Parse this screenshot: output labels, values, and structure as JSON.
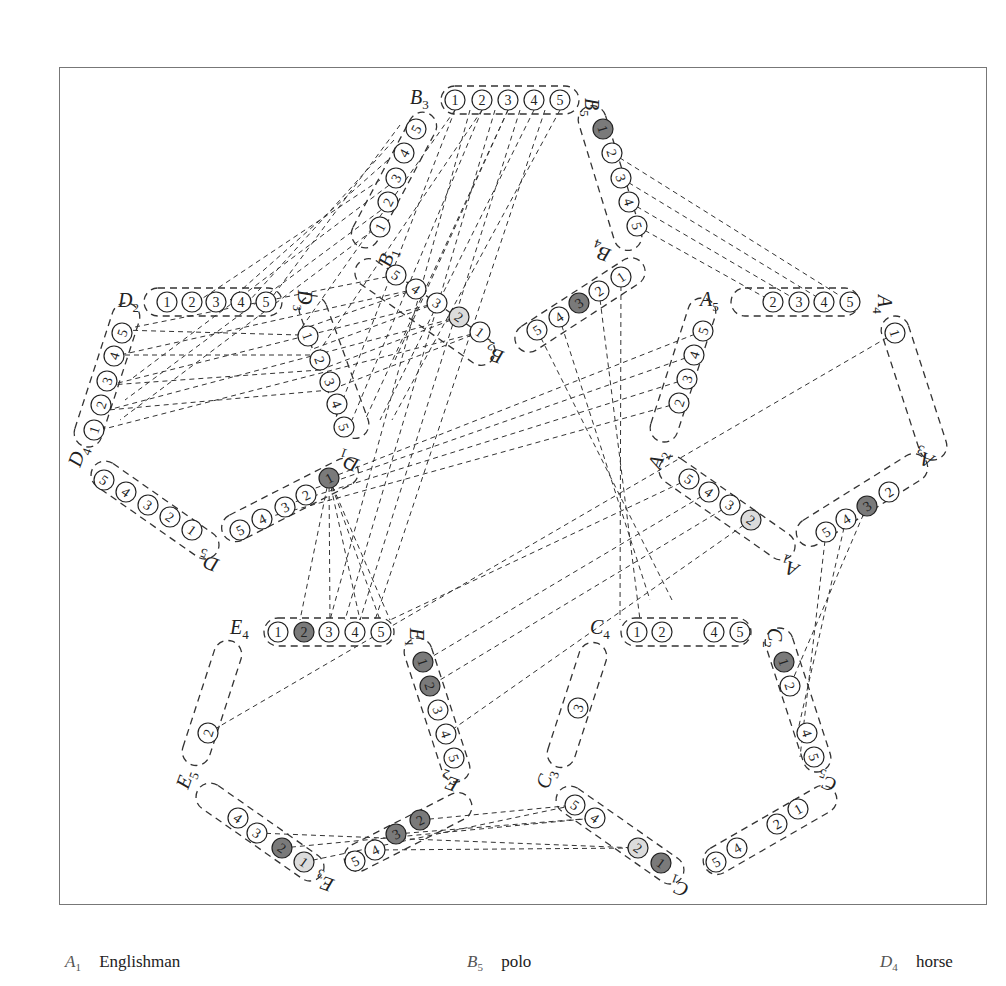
{
  "colors": {
    "line": "#333333",
    "frame": "#777777",
    "filled_dark": "#7a7a7a",
    "filled_light": "#dcdcdc",
    "background": "#ffffff"
  },
  "legend": [
    {
      "var": "A",
      "sub": "1",
      "meaning": "Englishman",
      "x": 65
    },
    {
      "var": "B",
      "sub": "5",
      "meaning": "polo",
      "x": 467
    },
    {
      "var": "D",
      "sub": "4",
      "meaning": "horse",
      "x": 880
    }
  ],
  "groups": [
    {
      "id": "B3",
      "label": "B",
      "sub": "3",
      "lx": 410,
      "ly": 104,
      "lrot": 0,
      "cx": 510,
      "cy": 100,
      "angle": 0,
      "len": 138,
      "wid": 28,
      "values": [
        {
          "n": "1",
          "x": 455,
          "y": 100
        },
        {
          "n": "2",
          "x": 482,
          "y": 100
        },
        {
          "n": "3",
          "x": 508,
          "y": 100
        },
        {
          "n": "4",
          "x": 534,
          "y": 100
        },
        {
          "n": "5",
          "x": 560,
          "y": 100
        }
      ]
    },
    {
      "id": "B5",
      "label": "B",
      "sub": "5",
      "lx": 585,
      "ly": 98,
      "lrot": 90,
      "cx": 610,
      "cy": 178,
      "angle": 73,
      "len": 150,
      "wid": 28,
      "values": [
        {
          "n": "1",
          "x": 603,
          "y": 129,
          "fill": "dark"
        },
        {
          "n": "2",
          "x": 612,
          "y": 153
        },
        {
          "n": "3",
          "x": 621,
          "y": 178
        },
        {
          "n": "4",
          "x": 629,
          "y": 202
        },
        {
          "n": "5",
          "x": 637,
          "y": 226
        }
      ]
    },
    {
      "id": "B1",
      "label": "B",
      "sub": "1",
      "lx": 390,
      "ly": 268,
      "lrot": -70,
      "cx": 394,
      "cy": 180,
      "angle": -62,
      "len": 150,
      "wid": 28,
      "values": [
        {
          "n": "1",
          "x": 380,
          "y": 227
        },
        {
          "n": "2",
          "x": 388,
          "y": 202
        },
        {
          "n": "3",
          "x": 396,
          "y": 178
        },
        {
          "n": "4",
          "x": 404,
          "y": 153
        },
        {
          "n": "5",
          "x": 416,
          "y": 129
        }
      ]
    },
    {
      "id": "D2",
      "label": "D",
      "sub": "2",
      "lx": 118,
      "ly": 307,
      "lrot": 0,
      "cx": 213,
      "cy": 302,
      "angle": 0,
      "len": 138,
      "wid": 28,
      "values": [
        {
          "n": "1",
          "x": 167,
          "y": 302
        },
        {
          "n": "2",
          "x": 192,
          "y": 302
        },
        {
          "n": "3",
          "x": 216,
          "y": 302
        },
        {
          "n": "4",
          "x": 241,
          "y": 302
        },
        {
          "n": "5",
          "x": 266,
          "y": 302
        }
      ]
    },
    {
      "id": "D3",
      "label": "D",
      "sub": "3",
      "lx": 298,
      "ly": 290,
      "lrot": 90,
      "cx": 334,
      "cy": 367,
      "angle": 70,
      "len": 150,
      "wid": 28,
      "values": [
        {
          "n": "1",
          "x": 308,
          "y": 336
        },
        {
          "n": "2",
          "x": 320,
          "y": 360
        },
        {
          "n": "3",
          "x": 330,
          "y": 382
        },
        {
          "n": "4",
          "x": 337,
          "y": 404
        },
        {
          "n": "5",
          "x": 344,
          "y": 427
        }
      ]
    },
    {
      "id": "D4",
      "label": "D",
      "sub": "4",
      "lx": 80,
      "ly": 468,
      "lrot": -70,
      "cx": 107,
      "cy": 375,
      "angle": -72,
      "len": 150,
      "wid": 28,
      "values": [
        {
          "n": "1",
          "x": 94,
          "y": 430
        },
        {
          "n": "2",
          "x": 101,
          "y": 405
        },
        {
          "n": "3",
          "x": 107,
          "y": 381
        },
        {
          "n": "4",
          "x": 114,
          "y": 356
        },
        {
          "n": "5",
          "x": 122,
          "y": 333
        }
      ]
    },
    {
      "id": "D5",
      "label": "D",
      "sub": "5",
      "lx": 220,
      "ly": 560,
      "lrot": 200,
      "cx": 155,
      "cy": 510,
      "angle": 35,
      "len": 150,
      "wid": 28,
      "values": [
        {
          "n": "5",
          "x": 104,
          "y": 480
        },
        {
          "n": "4",
          "x": 126,
          "y": 492
        },
        {
          "n": "3",
          "x": 148,
          "y": 505
        },
        {
          "n": "2",
          "x": 170,
          "y": 517
        },
        {
          "n": "1",
          "x": 192,
          "y": 530
        }
      ]
    },
    {
      "id": "D1",
      "label": "D",
      "sub": "1",
      "lx": 360,
      "ly": 460,
      "lrot": 200,
      "cx": 290,
      "cy": 500,
      "angle": -27,
      "len": 150,
      "wid": 28,
      "values": [
        {
          "n": "5",
          "x": 240,
          "y": 530
        },
        {
          "n": "4",
          "x": 262,
          "y": 519
        },
        {
          "n": "3",
          "x": 285,
          "y": 507
        },
        {
          "n": "2",
          "x": 306,
          "y": 495
        },
        {
          "n": "1",
          "x": 329,
          "y": 478,
          "fill": "dark"
        }
      ]
    },
    {
      "id": "B2",
      "label": "B",
      "sub": "2",
      "lx": 505,
      "ly": 352,
      "lrot": 200,
      "cx": 425,
      "cy": 312,
      "angle": 35,
      "len": 165,
      "wid": 28,
      "values": [
        {
          "n": "5",
          "x": 396,
          "y": 275
        },
        {
          "n": "4",
          "x": 416,
          "y": 289
        },
        {
          "n": "3",
          "x": 437,
          "y": 303
        },
        {
          "n": "2",
          "x": 459,
          "y": 317,
          "fill": "light"
        },
        {
          "n": "1",
          "x": 480,
          "y": 332
        }
      ]
    },
    {
      "id": "B4",
      "label": "B",
      "sub": "4",
      "lx": 612,
      "ly": 250,
      "lrot": 200,
      "cx": 580,
      "cy": 305,
      "angle": -33,
      "len": 150,
      "wid": 28,
      "values": [
        {
          "n": "5",
          "x": 537,
          "y": 330
        },
        {
          "n": "4",
          "x": 559,
          "y": 317
        },
        {
          "n": "3",
          "x": 579,
          "y": 303,
          "fill": "dark"
        },
        {
          "n": "2",
          "x": 599,
          "y": 291
        },
        {
          "n": "1",
          "x": 621,
          "y": 277
        }
      ]
    },
    {
      "id": "A5",
      "label": "A",
      "sub": "5",
      "lx": 700,
      "ly": 306,
      "lrot": 0,
      "cx": 795,
      "cy": 302,
      "angle": 0,
      "len": 128,
      "wid": 28,
      "values": [
        {
          "n": "2",
          "x": 773,
          "y": 302
        },
        {
          "n": "3",
          "x": 799,
          "y": 302
        },
        {
          "n": "4",
          "x": 824,
          "y": 302
        },
        {
          "n": "5",
          "x": 850,
          "y": 302
        }
      ]
    },
    {
      "id": "A4",
      "label": "A",
      "sub": "4",
      "lx": 878,
      "ly": 295,
      "lrot": 90,
      "cx": 914,
      "cy": 388,
      "angle": 72,
      "len": 150,
      "wid": 28,
      "values": [
        {
          "n": "1",
          "x": 895,
          "y": 333
        }
      ]
    },
    {
      "id": "A2",
      "label": "A",
      "sub": "2",
      "lx": 660,
      "ly": 470,
      "lrot": -70,
      "cx": 683,
      "cy": 370,
      "angle": -72,
      "len": 150,
      "wid": 28,
      "values": [
        {
          "n": "2",
          "x": 679,
          "y": 403
        },
        {
          "n": "3",
          "x": 687,
          "y": 379
        },
        {
          "n": "4",
          "x": 694,
          "y": 355
        },
        {
          "n": "5",
          "x": 703,
          "y": 331
        }
      ]
    },
    {
      "id": "A3",
      "label": "A",
      "sub": "3",
      "lx": 935,
      "ly": 456,
      "lrot": 200,
      "cx": 862,
      "cy": 500,
      "angle": -32,
      "len": 150,
      "wid": 28,
      "values": [
        {
          "n": "5",
          "x": 826,
          "y": 532
        },
        {
          "n": "4",
          "x": 846,
          "y": 519
        },
        {
          "n": "3",
          "x": 867,
          "y": 506,
          "fill": "dark"
        },
        {
          "n": "2",
          "x": 889,
          "y": 492
        }
      ]
    },
    {
      "id": "A1",
      "label": "A",
      "sub": "1",
      "lx": 800,
      "ly": 565,
      "lrot": 200,
      "cx": 727,
      "cy": 508,
      "angle": 35,
      "len": 160,
      "wid": 28,
      "values": [
        {
          "n": "5",
          "x": 689,
          "y": 479
        },
        {
          "n": "4",
          "x": 709,
          "y": 492
        },
        {
          "n": "3",
          "x": 730,
          "y": 505
        },
        {
          "n": "2",
          "x": 751,
          "y": 520,
          "fill": "light"
        }
      ]
    },
    {
      "id": "E4",
      "label": "E",
      "sub": "4",
      "lx": 230,
      "ly": 634,
      "lrot": 0,
      "cx": 329,
      "cy": 632,
      "angle": 0,
      "len": 130,
      "wid": 28,
      "values": [
        {
          "n": "1",
          "x": 278,
          "y": 632
        },
        {
          "n": "2",
          "x": 304,
          "y": 632,
          "fill": "dark"
        },
        {
          "n": "3",
          "x": 329,
          "y": 632
        },
        {
          "n": "4",
          "x": 355,
          "y": 632
        },
        {
          "n": "5",
          "x": 381,
          "y": 632
        }
      ]
    },
    {
      "id": "E1",
      "label": "E",
      "sub": "1",
      "lx": 410,
      "ly": 628,
      "lrot": 90,
      "cx": 437,
      "cy": 710,
      "angle": 72,
      "len": 150,
      "wid": 28,
      "values": [
        {
          "n": "1",
          "x": 423,
          "y": 662,
          "fill": "dark"
        },
        {
          "n": "2",
          "x": 430,
          "y": 686,
          "fill": "dark"
        },
        {
          "n": "3",
          "x": 438,
          "y": 710
        },
        {
          "n": "4",
          "x": 446,
          "y": 734
        },
        {
          "n": "5",
          "x": 454,
          "y": 758
        }
      ]
    },
    {
      "id": "E5",
      "label": "E",
      "sub": "5",
      "lx": 188,
      "ly": 790,
      "lrot": -70,
      "cx": 212,
      "cy": 703,
      "angle": -72,
      "len": 130,
      "wid": 28,
      "values": [
        {
          "n": "2",
          "x": 208,
          "y": 733
        }
      ]
    },
    {
      "id": "E2",
      "label": "E",
      "sub": "2",
      "lx": 460,
      "ly": 780,
      "lrot": 200,
      "cx": 408,
      "cy": 832,
      "angle": -27,
      "len": 140,
      "wid": 28,
      "values": [
        {
          "n": "5",
          "x": 355,
          "y": 861
        },
        {
          "n": "4",
          "x": 375,
          "y": 850
        },
        {
          "n": "3",
          "x": 396,
          "y": 834,
          "fill": "dark"
        },
        {
          "n": "2",
          "x": 420,
          "y": 820,
          "fill": "dark"
        }
      ]
    },
    {
      "id": "E3",
      "label": "E",
      "sub": "3",
      "lx": 335,
      "ly": 880,
      "lrot": 200,
      "cx": 260,
      "cy": 832,
      "angle": 35,
      "len": 150,
      "wid": 28,
      "values": [
        {
          "n": "4",
          "x": 238,
          "y": 818
        },
        {
          "n": "3",
          "x": 257,
          "y": 833
        },
        {
          "n": "2",
          "x": 282,
          "y": 848,
          "fill": "dark"
        },
        {
          "n": "1",
          "x": 304,
          "y": 862,
          "fill": "light"
        }
      ]
    },
    {
      "id": "C4",
      "label": "C",
      "sub": "4",
      "lx": 590,
      "ly": 634,
      "lrot": 0,
      "cx": 686,
      "cy": 632,
      "angle": 0,
      "len": 130,
      "wid": 28,
      "values": [
        {
          "n": "1",
          "x": 637,
          "y": 632
        },
        {
          "n": "2",
          "x": 662,
          "y": 632
        },
        {
          "n": "4",
          "x": 714,
          "y": 632
        },
        {
          "n": "5",
          "x": 740,
          "y": 632
        }
      ]
    },
    {
      "id": "C2",
      "label": "C",
      "sub": "2",
      "lx": 768,
      "ly": 628,
      "lrot": 90,
      "cx": 798,
      "cy": 700,
      "angle": 72,
      "len": 150,
      "wid": 28,
      "values": [
        {
          "n": "1",
          "x": 784,
          "y": 662,
          "fill": "dark"
        },
        {
          "n": "2",
          "x": 790,
          "y": 686
        },
        {
          "n": "4",
          "x": 807,
          "y": 733
        },
        {
          "n": "5",
          "x": 814,
          "y": 757
        }
      ]
    },
    {
      "id": "C3",
      "label": "C",
      "sub": "3",
      "lx": 548,
      "ly": 790,
      "lrot": -70,
      "cx": 577,
      "cy": 705,
      "angle": -72,
      "len": 130,
      "wid": 28,
      "values": [
        {
          "n": "3",
          "x": 578,
          "y": 708
        }
      ]
    },
    {
      "id": "C5",
      "label": "C",
      "sub": "5",
      "lx": 838,
      "ly": 780,
      "lrot": 200,
      "cx": 770,
      "cy": 830,
      "angle": -30,
      "len": 150,
      "wid": 28,
      "values": [
        {
          "n": "5",
          "x": 716,
          "y": 862
        },
        {
          "n": "4",
          "x": 737,
          "y": 848
        },
        {
          "n": "2",
          "x": 777,
          "y": 824
        },
        {
          "n": "1",
          "x": 798,
          "y": 809
        }
      ]
    },
    {
      "id": "C1",
      "label": "C",
      "sub": "1",
      "lx": 690,
      "ly": 885,
      "lrot": 200,
      "cx": 620,
      "cy": 835,
      "angle": 35,
      "len": 150,
      "wid": 28,
      "values": [
        {
          "n": "5",
          "x": 575,
          "y": 805
        },
        {
          "n": "4",
          "x": 595,
          "y": 818
        },
        {
          "n": "2",
          "x": 638,
          "y": 848,
          "fill": "light"
        },
        {
          "n": "1",
          "x": 661,
          "y": 863,
          "fill": "dark"
        }
      ]
    }
  ],
  "edges": [
    [
      455,
      110,
      335,
      420
    ],
    [
      482,
      110,
      352,
      420
    ],
    [
      508,
      110,
      365,
      420
    ],
    [
      534,
      110,
      380,
      420
    ],
    [
      560,
      110,
      392,
      420
    ],
    [
      470,
      110,
      330,
      620
    ],
    [
      495,
      110,
      345,
      620
    ],
    [
      520,
      110,
      360,
      620
    ],
    [
      545,
      110,
      375,
      620
    ],
    [
      455,
      110,
      300,
      330
    ],
    [
      482,
      110,
      320,
      350
    ],
    [
      508,
      110,
      395,
      360
    ],
    [
      400,
      125,
      270,
      300
    ],
    [
      394,
      140,
      250,
      300
    ],
    [
      388,
      160,
      230,
      300
    ],
    [
      380,
      180,
      200,
      300
    ],
    [
      380,
      225,
      120,
      420
    ],
    [
      388,
      205,
      125,
      400
    ],
    [
      396,
      180,
      130,
      380
    ],
    [
      637,
      226,
      773,
      302
    ],
    [
      629,
      202,
      800,
      302
    ],
    [
      621,
      178,
      825,
      302
    ],
    [
      612,
      153,
      850,
      302
    ],
    [
      396,
      275,
      120,
      330
    ],
    [
      416,
      289,
      120,
      355
    ],
    [
      437,
      303,
      110,
      385
    ],
    [
      459,
      317,
      108,
      410
    ],
    [
      480,
      332,
      100,
      430
    ],
    [
      300,
      335,
      120,
      330
    ],
    [
      310,
      355,
      120,
      355
    ],
    [
      320,
      370,
      110,
      385
    ],
    [
      330,
      390,
      108,
      410
    ],
    [
      416,
      289,
      300,
      330
    ],
    [
      437,
      303,
      310,
      350
    ],
    [
      459,
      317,
      320,
      370
    ],
    [
      480,
      332,
      330,
      390
    ],
    [
      537,
      330,
      672,
      600
    ],
    [
      559,
      317,
      650,
      600
    ],
    [
      599,
      291,
      640,
      620
    ],
    [
      621,
      277,
      620,
      620
    ],
    [
      703,
      331,
      330,
      478
    ],
    [
      694,
      355,
      310,
      490
    ],
    [
      687,
      379,
      285,
      505
    ],
    [
      679,
      403,
      262,
      519
    ],
    [
      895,
      333,
      208,
      733
    ],
    [
      689,
      479,
      390,
      620
    ],
    [
      709,
      492,
      423,
      662
    ],
    [
      730,
      505,
      430,
      686
    ],
    [
      751,
      520,
      446,
      734
    ],
    [
      826,
      532,
      800,
      757
    ],
    [
      846,
      519,
      798,
      730
    ],
    [
      867,
      506,
      790,
      686
    ],
    [
      329,
      478,
      300,
      620
    ],
    [
      329,
      478,
      330,
      620
    ],
    [
      329,
      478,
      360,
      620
    ],
    [
      329,
      478,
      380,
      620
    ],
    [
      329,
      478,
      390,
      620
    ],
    [
      420,
      820,
      575,
      805
    ],
    [
      396,
      834,
      595,
      818
    ],
    [
      375,
      850,
      638,
      848
    ],
    [
      304,
      862,
      575,
      805
    ],
    [
      282,
      848,
      595,
      818
    ],
    [
      257,
      833,
      638,
      848
    ]
  ]
}
